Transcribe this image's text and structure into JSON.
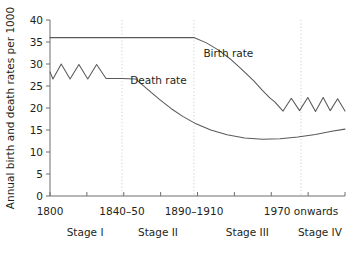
{
  "chart_data": {
    "type": "line",
    "title": "",
    "xlabel": "",
    "ylabel": "Annual birth and death rates per 1000",
    "ylim": [
      0,
      40
    ],
    "ytick_values": [
      0,
      5,
      10,
      15,
      20,
      25,
      30,
      35,
      40
    ],
    "ytick_labels": [
      "0",
      "5",
      "10",
      "15",
      "20",
      "25",
      "30",
      "35",
      "40"
    ],
    "grid": false,
    "legend_position": "inline-annotation",
    "xtick_labels": [
      "1800",
      "1840–50",
      "1890–1910",
      "1970 onwards"
    ],
    "xtick_fractions": [
      0.0,
      0.2441,
      0.4881,
      0.8508
    ],
    "stage_labels": [
      "Stage I",
      "Stage II",
      "Stage III",
      "Stage IV"
    ],
    "stage_label_fractions": [
      0.119,
      0.366,
      0.669,
      0.915
    ],
    "divider_fractions": [
      0.2441,
      0.4881,
      0.8508
    ],
    "series": [
      {
        "name": "Birth rate",
        "annotation": "Birth rate",
        "annotation_point": [
          0.52,
          31.5
        ],
        "points": [
          [
            0.0,
            36.0
          ],
          [
            0.244,
            36.0
          ],
          [
            0.488,
            36.0
          ],
          [
            0.53,
            34.8
          ],
          [
            0.57,
            33.2
          ],
          [
            0.61,
            31.2
          ],
          [
            0.65,
            28.8
          ],
          [
            0.69,
            26.2
          ],
          [
            0.72,
            24.0
          ],
          [
            0.745,
            22.3
          ],
          [
            0.762,
            21.4
          ],
          [
            0.79,
            19.3
          ],
          [
            0.818,
            22.2
          ],
          [
            0.846,
            19.4
          ],
          [
            0.874,
            22.4
          ],
          [
            0.9,
            19.2
          ],
          [
            0.926,
            22.4
          ],
          [
            0.95,
            19.4
          ],
          [
            0.975,
            22.1
          ],
          [
            1.0,
            19.3
          ],
          [
            1.0,
            19.3
          ]
        ]
      },
      {
        "name": "Death rate",
        "annotation": "Death rate",
        "annotation_point": [
          0.272,
          25.4
        ],
        "points": [
          [
            0.0,
            28.2
          ],
          [
            0.01,
            26.6
          ],
          [
            0.038,
            30.0
          ],
          [
            0.068,
            26.6
          ],
          [
            0.098,
            29.9
          ],
          [
            0.128,
            26.6
          ],
          [
            0.158,
            29.9
          ],
          [
            0.19,
            26.7
          ],
          [
            0.244,
            26.7
          ],
          [
            0.29,
            26.6
          ],
          [
            0.33,
            24.3
          ],
          [
            0.37,
            22.0
          ],
          [
            0.41,
            19.9
          ],
          [
            0.45,
            18.1
          ],
          [
            0.495,
            16.4
          ],
          [
            0.545,
            15.0
          ],
          [
            0.6,
            13.9
          ],
          [
            0.66,
            13.2
          ],
          [
            0.72,
            12.9
          ],
          [
            0.78,
            13.0
          ],
          [
            0.84,
            13.4
          ],
          [
            0.9,
            14.0
          ],
          [
            0.955,
            14.7
          ],
          [
            1.0,
            15.2
          ]
        ]
      }
    ]
  },
  "axes": {
    "plot_left_px": 50,
    "plot_right_px": 345,
    "plot_top_px": 20,
    "plot_bottom_px": 196
  }
}
